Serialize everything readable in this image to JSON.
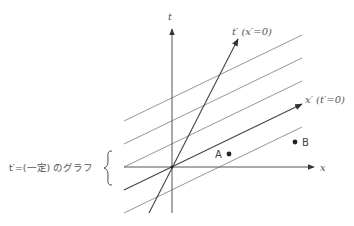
{
  "diagram": {
    "type": "spacetime-diagram",
    "axes": {
      "t": {
        "label": "t"
      },
      "x": {
        "label": "x"
      },
      "t_prime": {
        "label": "t′ (x′=0)"
      },
      "x_prime": {
        "label": "x′ (t′=0)"
      }
    },
    "points": [
      {
        "id": "A",
        "label": "A"
      },
      {
        "id": "B",
        "label": "B"
      }
    ],
    "brace_label": "t′=(一定) のグラフ",
    "colors": {
      "line": "#777777",
      "axis": "#444444",
      "text": "#555555",
      "point": "#222222"
    }
  }
}
